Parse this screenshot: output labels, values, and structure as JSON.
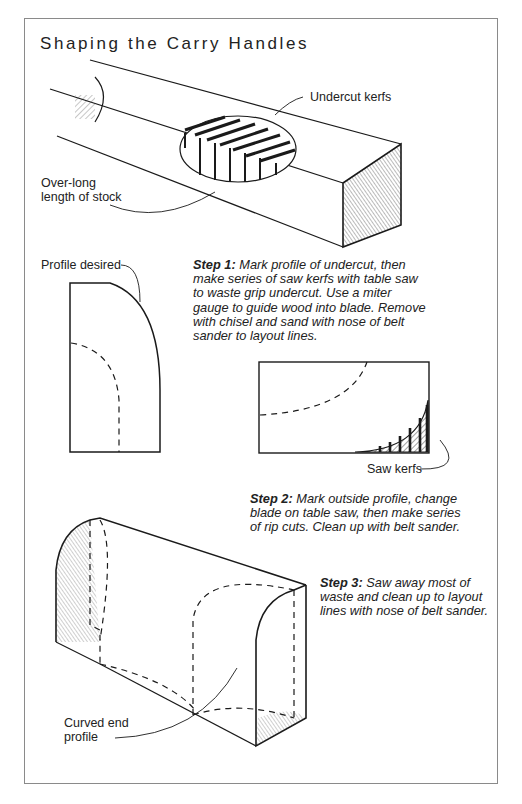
{
  "title": "Shaping the Carry Handles",
  "labels": {
    "undercut_kerfs": "Undercut kerfs",
    "overlong_1": "Over-long",
    "overlong_2": "length of stock",
    "profile_desired": "Profile desired",
    "saw_kerfs": "Saw kerfs",
    "curved_end_1": "Curved end",
    "curved_end_2": "profile"
  },
  "steps": [
    {
      "label": "Step 1:",
      "lines": [
        "Mark profile of undercut, then",
        "make series of saw kerfs with table saw",
        "to waste grip undercut. Use a miter",
        "gauge to guide wood into blade. Remove",
        "with chisel and sand with nose of belt",
        "sander to layout lines."
      ]
    },
    {
      "label": "Step 2:",
      "lines": [
        "Mark outside profile, change",
        "blade on table saw, then make series",
        "of rip cuts. Clean up with belt sander."
      ]
    },
    {
      "label": "Step 3:",
      "lines": [
        "Saw away most of",
        "waste and clean up to layout",
        "lines with nose of belt sander."
      ]
    }
  ],
  "colors": {
    "ink": "#1a1a1a",
    "frame": "#8a8a8a"
  }
}
